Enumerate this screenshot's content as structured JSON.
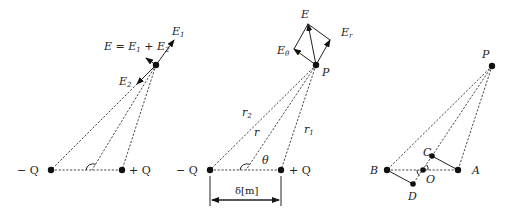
{
  "diagrams": [
    {
      "id": "left",
      "description": "Resultant field at point from dipole charges",
      "labels": {
        "E_sum": "E = E",
        "E_sum_sub1": "1",
        "E_sum_plus": " + E",
        "E_sum_sub2": "2",
        "E1": "E",
        "E1_sub": "1",
        "E2": "E",
        "E2_sub": "2",
        "neg_charge": "− Q",
        "pos_charge": "+ Q"
      }
    },
    {
      "id": "middle",
      "description": "Polar components of dipole field at point P",
      "labels": {
        "E": "E",
        "E_theta": "E",
        "E_theta_sub": "θ",
        "E_r": "E",
        "E_r_sub": "r",
        "P": "P",
        "r2": "r",
        "r2_sub": "2",
        "r": "r",
        "r1": "r",
        "r1_sub": "1",
        "theta": "θ",
        "neg_charge": "− Q",
        "pos_charge": "+ Q",
        "separation": "δ[m]"
      }
    },
    {
      "id": "right",
      "description": "Geometric construction for dipole distances",
      "labels": {
        "P": "P",
        "B": "B",
        "A": "A",
        "O": "O",
        "C": "C",
        "D": "D"
      }
    }
  ]
}
